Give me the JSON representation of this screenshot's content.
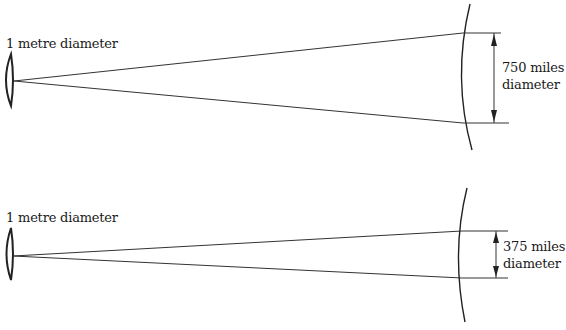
{
  "diagrams": [
    {
      "id": "top",
      "mirror_label": "1 metre diameter",
      "spot_label_line1": "750 miles",
      "spot_label_line2": "diameter"
    },
    {
      "id": "bottom",
      "mirror_label": "1 metre diameter",
      "spot_label_line1": "375 miles",
      "spot_label_line2": "diameter"
    }
  ],
  "colors": {
    "line": "#222222",
    "background": "#ffffff"
  }
}
